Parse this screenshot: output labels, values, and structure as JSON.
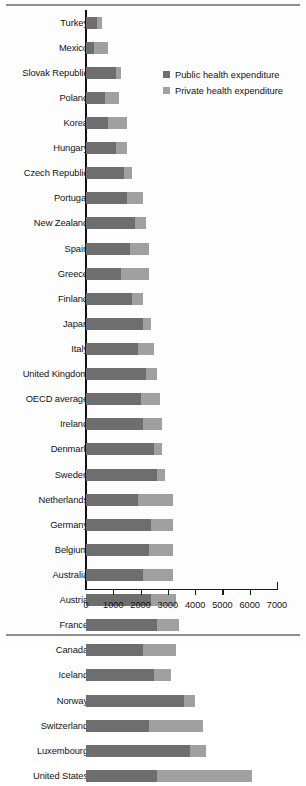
{
  "legend": {
    "position": "top-right",
    "items": [
      {
        "label": "Public health expenditure",
        "color": "#6e6e6e",
        "key": "public"
      },
      {
        "label": "Private health expenditure",
        "color": "#a0a0a0",
        "key": "private"
      }
    ]
  },
  "axis": {
    "ticks": [
      "0",
      "1000",
      "2000",
      "3000",
      "4000",
      "5000",
      "6000",
      "7000"
    ],
    "min": 0,
    "max": 7000,
    "step": 1000
  },
  "chart_data": {
    "type": "bar",
    "orientation": "horizontal",
    "stacked": true,
    "title": "",
    "xlabel": "",
    "ylabel": "",
    "xlim": [
      0,
      7000
    ],
    "grid": false,
    "legend_position": "top-right",
    "categories": [
      "Turkey",
      "Mexico",
      "Slovak Republic",
      "Poland",
      "Korea",
      "Hungary",
      "Czech Republic",
      "Portugal",
      "New Zealand",
      "Spain",
      "Greece",
      "Finland",
      "Japan",
      "Italy",
      "United Kingdom",
      "OECD average",
      "Ireland",
      "Denmark",
      "Sweden",
      "Netherlands",
      "Germany",
      "Belgium",
      "Australia",
      "Austria",
      "France",
      "Canada",
      "Iceland",
      "Norway",
      "Switzerland",
      "Luxembourg",
      "United States"
    ],
    "series": [
      {
        "name": "Public health expenditure",
        "color": "#6e6e6e",
        "values": [
          400,
          300,
          1100,
          700,
          800,
          1100,
          1400,
          1500,
          1800,
          1600,
          1300,
          1700,
          2100,
          1900,
          2200,
          2000,
          2100,
          2500,
          2600,
          1900,
          2400,
          2300,
          2100,
          2400,
          2600,
          2100,
          2500,
          3600,
          2300,
          3800,
          2600
        ]
      },
      {
        "name": "Private health expenditure",
        "color": "#a0a0a0",
        "values": [
          200,
          500,
          200,
          500,
          700,
          400,
          300,
          600,
          400,
          700,
          1000,
          400,
          300,
          600,
          400,
          700,
          700,
          300,
          300,
          1300,
          800,
          900,
          1100,
          900,
          800,
          1200,
          600,
          400,
          2000,
          600,
          3500
        ]
      }
    ]
  }
}
